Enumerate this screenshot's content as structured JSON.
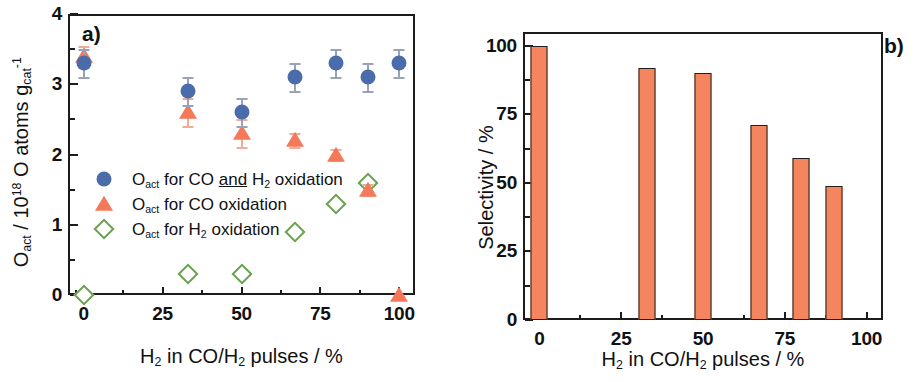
{
  "figure": {
    "panel_a_letter": "a)",
    "panel_b_letter": "b)"
  },
  "panel_a": {
    "y_title_html": "O<sub>act</sub> / 10<sup>18</sup> O atoms g<sub>cat</sub><sup>-1</sup>",
    "x_title_html": "H<sub>2</sub> in CO/H<sub>2</sub> pulses / %",
    "y_ticks": [
      "0",
      "1",
      "2",
      "3",
      "4"
    ],
    "x_ticks": [
      "0",
      "25",
      "50",
      "75",
      "100"
    ],
    "legend": [
      {
        "marker": "blue-filled-circle",
        "text_html": "O<sub>act</sub> for CO <span class=\"underline\">and</span> H<sub>2</sub> oxidation"
      },
      {
        "marker": "orange-filled-triangle",
        "text_html": "O<sub>act</sub> for CO oxidation"
      },
      {
        "marker": "green-open-diamond",
        "text_html": "O<sub>act</sub> for H<sub>2</sub> oxidation"
      }
    ]
  },
  "panel_b": {
    "y_title_html": "Selectivity / %",
    "x_title_html": "H<sub>2</sub> in CO/H<sub>2</sub> pulses / %",
    "y_ticks": [
      "0",
      "25",
      "50",
      "75",
      "100"
    ],
    "x_ticks": [
      "0",
      "25",
      "50",
      "75",
      "100"
    ]
  },
  "colors": {
    "blue_circle": "#4b6cab",
    "orange_triangle": "#f4795b",
    "green_diamond": "#69a24e",
    "bar_fill": "#f4855f",
    "axis": "#1c1c1c"
  },
  "chart_data": [
    {
      "type": "scatter",
      "panel": "a",
      "title": "",
      "xlabel": "H2 in CO/H2 pulses / %",
      "ylabel": "Oact / 10^18 O atoms gcat^-1",
      "xlim": [
        -5,
        105
      ],
      "ylim": [
        0,
        4
      ],
      "xticks": [
        0,
        25,
        50,
        75,
        100
      ],
      "yticks": [
        0,
        1,
        2,
        3,
        4
      ],
      "grid": false,
      "legend_position": "center-left",
      "series": [
        {
          "name": "Oact for CO and H2 oxidation",
          "marker": "filled circle",
          "color": "#4b6cab",
          "x": [
            0,
            33,
            50,
            67,
            80,
            90,
            100
          ],
          "y": [
            3.3,
            2.9,
            2.6,
            3.1,
            3.3,
            3.1,
            3.3
          ],
          "yerr": [
            0.2,
            0.2,
            0.2,
            0.2,
            0.2,
            0.2,
            0.2
          ]
        },
        {
          "name": "Oact for CO oxidation",
          "marker": "filled triangle",
          "color": "#f4795b",
          "x": [
            0,
            33,
            50,
            67,
            80,
            90,
            100
          ],
          "y": [
            3.4,
            2.6,
            2.3,
            2.2,
            2.0,
            1.5,
            0.0
          ],
          "yerr": [
            0.15,
            0.2,
            0.2,
            0.1,
            0.08,
            0.08,
            0.0
          ]
        },
        {
          "name": "Oact for H2 oxidation",
          "marker": "open diamond",
          "color": "#69a24e",
          "x": [
            0,
            33,
            50,
            67,
            80,
            90
          ],
          "y": [
            0.0,
            0.3,
            0.3,
            0.9,
            1.3,
            1.6
          ],
          "yerr": [
            0,
            0,
            0,
            0,
            0,
            0
          ]
        }
      ]
    },
    {
      "type": "bar",
      "panel": "b",
      "title": "",
      "xlabel": "H2 in CO/H2 pulses / %",
      "ylabel": "Selectivity / %",
      "xlim": [
        -5,
        105
      ],
      "ylim": [
        0,
        105
      ],
      "xticks": [
        0,
        25,
        50,
        75,
        100
      ],
      "yticks": [
        0,
        25,
        50,
        75,
        100
      ],
      "grid": false,
      "categories": [
        0,
        33,
        50,
        67,
        80,
        90
      ],
      "values": [
        100,
        92,
        90,
        71,
        59,
        49
      ],
      "bar_color": "#f4855f"
    }
  ]
}
